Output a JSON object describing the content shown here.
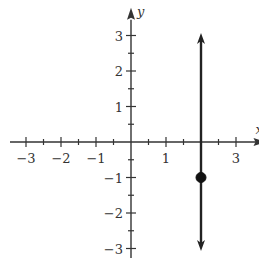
{
  "chart_data": {
    "type": "line",
    "title": "",
    "xlabel": "x",
    "ylabel": "y",
    "xlim": [
      -3.5,
      3.5
    ],
    "ylim": [
      -3,
      3.5
    ],
    "grid": false,
    "x_ticks": [
      -3,
      -2,
      -1,
      1,
      3
    ],
    "x_tick_labels": [
      "−3",
      "−2",
      "−1",
      "1",
      "3"
    ],
    "y_ticks": [
      3,
      2,
      1,
      -1,
      -2,
      -3
    ],
    "y_tick_labels": [
      "3",
      "2",
      "1",
      "−1",
      "−2",
      "−3"
    ],
    "minor_tick_step": 0.5,
    "series": [
      {
        "name": "vertical line x = 2",
        "type": "line",
        "x": [
          2,
          2
        ],
        "y": [
          -2.9,
          2.9
        ],
        "arrows": "both",
        "color": "#222222"
      }
    ],
    "points": [
      {
        "x": 2,
        "y": -1,
        "filled": true,
        "color": "#111111"
      }
    ]
  },
  "colors": {
    "axis": "#333333",
    "line": "#222222",
    "point": "#111111"
  }
}
